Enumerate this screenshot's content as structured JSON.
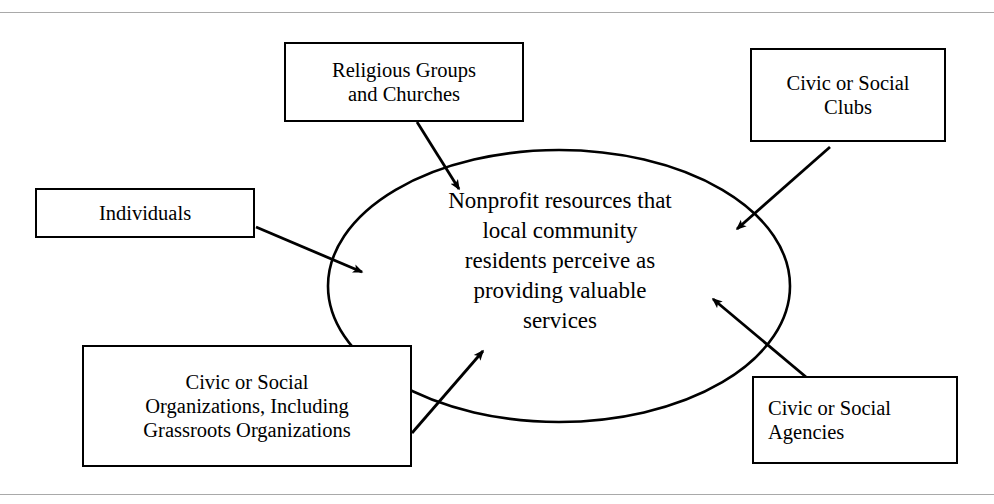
{
  "figure": {
    "type": "concept-diagram",
    "center": {
      "shape": "ellipse",
      "text": "Nonprofit resources that\nlocal community\nresidents perceive as\nproviding valuable\nservices",
      "lines": [
        "Nonprofit resources that",
        "local community",
        "residents perceive as",
        "providing valuable",
        "services"
      ]
    },
    "nodes": [
      {
        "id": "religious",
        "text": "Religious Groups\nand Churches",
        "lines": [
          "Religious Groups",
          "and Churches"
        ],
        "align": "center"
      },
      {
        "id": "clubs",
        "text": "Civic or Social\nClubs",
        "lines": [
          "Civic or Social",
          "Clubs"
        ],
        "align": "center"
      },
      {
        "id": "individuals",
        "text": "Individuals",
        "lines": [
          "Individuals"
        ],
        "align": "center"
      },
      {
        "id": "organizations",
        "text": "Civic or Social\nOrganizations, Including\nGrassroots Organizations",
        "lines": [
          "Civic or Social",
          "Organizations, Including",
          "Grassroots Organizations"
        ],
        "align": "center"
      },
      {
        "id": "agencies",
        "text": "Civic or Social\nAgencies",
        "lines": [
          "Civic or Social",
          "Agencies"
        ],
        "align": "left"
      }
    ],
    "connectors": [
      {
        "id": "religious-to-center",
        "from": "religious",
        "to": "center",
        "direction": "down-right"
      },
      {
        "id": "clubs-to-center",
        "from": "clubs",
        "to": "center",
        "direction": "down-left"
      },
      {
        "id": "individuals-to-center",
        "from": "individuals",
        "to": "center",
        "direction": "down-right"
      },
      {
        "id": "organizations-to-center",
        "from": "organizations",
        "to": "center",
        "direction": "up-right"
      },
      {
        "id": "agencies-to-center",
        "from": "agencies",
        "to": "center",
        "direction": "up-left"
      }
    ],
    "colors": {
      "stroke": "#000000",
      "fill": "#ffffff",
      "rule": "#a9a9a9",
      "text": "#000000"
    },
    "rules": {
      "top": "horizontal-rule",
      "bottom": "horizontal-rule"
    }
  }
}
